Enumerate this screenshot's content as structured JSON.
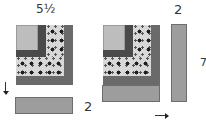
{
  "diagram": {
    "left_block": {
      "top_label": "5½",
      "strip_label": "2"
    },
    "right_block": {
      "strip_label_top": "2",
      "side_label": "7"
    },
    "colors": {
      "center": "#bdbdbd",
      "dark_log": "#4a4a4a",
      "print_fabric": "#d8d8d8",
      "border_log": "#6a6a6a",
      "added_strip": "#9d9d9d"
    }
  }
}
